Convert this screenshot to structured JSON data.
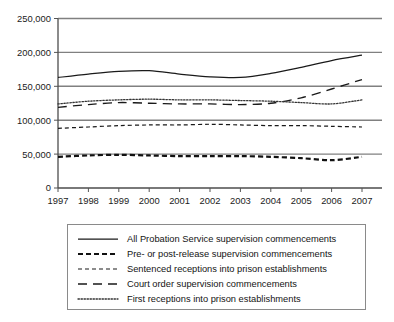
{
  "chart_data": {
    "type": "line",
    "title": "",
    "xlabel": "",
    "ylabel": "",
    "categories": [
      1997,
      1998,
      1999,
      2000,
      2001,
      2002,
      2003,
      2004,
      2005,
      2006,
      2007
    ],
    "x_tick_labels": [
      "1997",
      "1998",
      "1999",
      "2000",
      "2001",
      "2002",
      "2003",
      "2004",
      "2005",
      "2006",
      "2007"
    ],
    "y_tick_labels": [
      "0",
      "50,000",
      "100,000",
      "150,000",
      "200,000",
      "250,000"
    ],
    "y_tick_values": [
      0,
      50000,
      100000,
      150000,
      200000,
      250000
    ],
    "ylim": [
      0,
      250000
    ],
    "xlim": [
      1997,
      2007
    ],
    "grid": "horizontal",
    "legend_position": "below-plot",
    "series": [
      {
        "name": "All Probation Service supervision commencements",
        "style": "solid",
        "color": "#1a1a1a",
        "values": [
          163000,
          168000,
          172000,
          173000,
          168000,
          164000,
          163000,
          169000,
          178000,
          188000,
          196000
        ]
      },
      {
        "name": "Pre- or post-release supervision commencements",
        "style": "bold-dash",
        "color": "#111111",
        "values": [
          46000,
          48000,
          49000,
          48000,
          47000,
          47000,
          47000,
          46000,
          44000,
          41000,
          46000
        ]
      },
      {
        "name": "Sentenced receptions into prison establishments",
        "style": "short-dash",
        "color": "#1a1a1a",
        "values": [
          88000,
          90000,
          92000,
          93000,
          93000,
          94000,
          93000,
          92000,
          92000,
          91000,
          90000
        ]
      },
      {
        "name": "Court order supervision commencements",
        "style": "long-dash",
        "color": "#1a1a1a",
        "values": [
          119000,
          123000,
          126000,
          125000,
          124000,
          124000,
          123000,
          125000,
          133000,
          146000,
          160000
        ]
      },
      {
        "name": "First receptions into prison establishments",
        "style": "dotted",
        "color": "#333333",
        "values": [
          124000,
          128000,
          130000,
          131000,
          130000,
          130000,
          129000,
          128000,
          126000,
          124000,
          130000
        ]
      }
    ]
  },
  "legend": {
    "items": [
      {
        "label": "All Probation Service supervision commencements"
      },
      {
        "label": "Pre- or post-release supervision commencements"
      },
      {
        "label": "Sentenced receptions into prison establishments"
      },
      {
        "label": "Court order supervision commencements"
      },
      {
        "label": "First receptions into prison establishments"
      }
    ]
  }
}
